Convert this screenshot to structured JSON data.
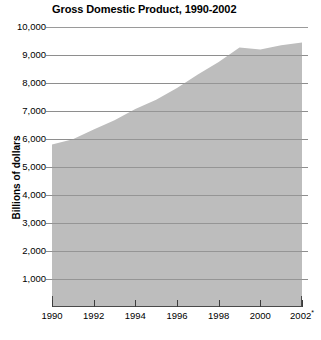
{
  "chart_data": {
    "type": "area",
    "title": "Gross Domestic Product, 1990-2002",
    "xlabel": "",
    "ylabel": "Billions of dollars",
    "ylim": [
      0,
      10000
    ],
    "xlim": [
      1990,
      2002
    ],
    "grid": true,
    "legend": null,
    "fill_color": "#bdbdbd",
    "gridline_color": "#8e8e8e",
    "axis_color": "#4a4a4a",
    "x": [
      1990,
      1991,
      1992,
      1993,
      1994,
      1995,
      1996,
      1997,
      1998,
      1999,
      2000,
      2001,
      2002
    ],
    "values": [
      5800,
      5990,
      6340,
      6670,
      7070,
      7400,
      7820,
      8300,
      8750,
      9270,
      9200,
      9350,
      9450
    ],
    "series": [
      {
        "name": "Gross Domestic Product",
        "values": [
          5800,
          5990,
          6340,
          6670,
          7070,
          7400,
          7820,
          8300,
          8750,
          9270,
          9200,
          9350,
          9450
        ]
      }
    ],
    "y_ticks": [
      1000,
      2000,
      3000,
      4000,
      5000,
      6000,
      7000,
      8000,
      9000,
      10000
    ],
    "y_tick_labels": [
      "1,000",
      "2,000",
      "3,000",
      "4,000",
      "5,000",
      "6,000",
      "7,000",
      "8,000",
      "9,000",
      "10,000"
    ],
    "x_ticks": [
      1990,
      1992,
      1994,
      1996,
      1998,
      2000,
      2002
    ],
    "x_tick_labels": [
      "1990",
      "1992",
      "1994",
      "1996",
      "1998",
      "2000",
      "2002"
    ],
    "x_tick_superscripts": [
      "",
      "",
      "",
      "",
      "",
      "",
      "*"
    ],
    "annotations": [
      "*"
    ]
  }
}
